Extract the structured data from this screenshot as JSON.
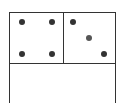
{
  "diagram": {
    "type": "tile-with-pips",
    "panels": [
      {
        "name": "top-left",
        "pips": 4
      },
      {
        "name": "top-right",
        "pips": 3
      },
      {
        "name": "bottom",
        "pips": 0
      }
    ],
    "colors": {
      "line": "#333333",
      "pip": "#333333",
      "background": "#ffffff"
    }
  }
}
